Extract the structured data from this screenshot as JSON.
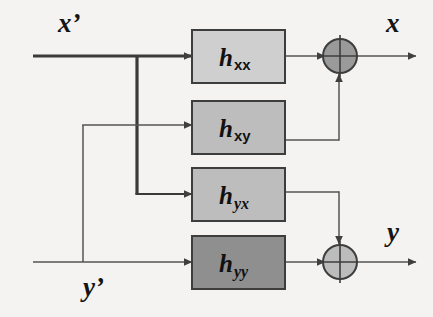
{
  "diagram": {
    "background_color": "#f4f3f1",
    "line_color": "#4a4a4a",
    "thick_line_color": "#3a3a3a",
    "block_border_color": "#3d3d3d",
    "inputs": [
      {
        "id": "x-prime",
        "label": "x’",
        "row": "top"
      },
      {
        "id": "y-prime",
        "label": "y’",
        "row": "bottom"
      }
    ],
    "outputs": [
      {
        "id": "x-out",
        "label": "x",
        "row": "top"
      },
      {
        "id": "y-out",
        "label": "y",
        "row": "bottom"
      }
    ],
    "blocks": [
      {
        "id": "h-xx",
        "base": "h",
        "sub": "xx",
        "sub_italic": false,
        "fill": "#cfcfcf"
      },
      {
        "id": "h-xy",
        "base": "h",
        "sub": "xy",
        "sub_italic": false,
        "fill": "#bdbdbd"
      },
      {
        "id": "h-yx",
        "base": "h",
        "sub": "yx",
        "sub_italic": true,
        "fill": "#bdbdbd"
      },
      {
        "id": "h-yy",
        "base": "h",
        "sub": "yy",
        "sub_italic": true,
        "fill": "#8f8f8f"
      }
    ],
    "summers": [
      {
        "id": "summer-x",
        "fill": "#9a9a9a",
        "inputs": [
          "h-xx",
          "h-xy"
        ],
        "output": "x-out"
      },
      {
        "id": "summer-y",
        "fill": "#bcbcbc",
        "inputs": [
          "h-yy",
          "h-yx"
        ],
        "output": "y-out"
      }
    ],
    "connections": [
      {
        "from": "x-prime",
        "to": "h-xx",
        "style": "thick"
      },
      {
        "from": "x-prime",
        "to": "h-yx",
        "style": "thick"
      },
      {
        "from": "y-prime",
        "to": "h-yy",
        "style": "thin"
      },
      {
        "from": "y-prime",
        "to": "h-xy",
        "style": "thin"
      },
      {
        "from": "h-xx",
        "to": "summer-x",
        "style": "thin"
      },
      {
        "from": "h-xy",
        "to": "summer-x",
        "style": "thin"
      },
      {
        "from": "h-yx",
        "to": "summer-y",
        "style": "thin"
      },
      {
        "from": "h-yy",
        "to": "summer-y",
        "style": "thin"
      },
      {
        "from": "summer-x",
        "to": "x-out",
        "style": "thin"
      },
      {
        "from": "summer-y",
        "to": "y-out",
        "style": "thin"
      }
    ]
  }
}
